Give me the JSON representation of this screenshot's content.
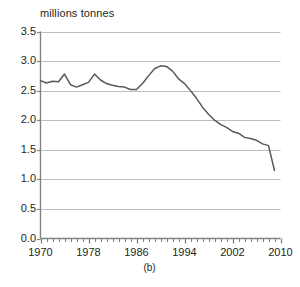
{
  "figure": {
    "caption": "(b)",
    "axis_title": "millions tonnes",
    "line_color": "#58595b",
    "grid_color": "#bcbec0",
    "axis_color": "#808285",
    "text_color": "#231f20"
  },
  "chart_data": {
    "type": "line",
    "title": "",
    "subtitle": "",
    "xlabel": "",
    "ylabel": "millions tonnes",
    "xlim": [
      1970,
      2010
    ],
    "ylim": [
      0.0,
      3.5
    ],
    "grid": true,
    "legend": "none",
    "y_ticks": [
      "0.0",
      "0.5",
      "1.0",
      "1.5",
      "2.0",
      "2.5",
      "3.0",
      "3.5"
    ],
    "y_tick_values": [
      0.0,
      0.5,
      1.0,
      1.5,
      2.0,
      2.5,
      3.0,
      3.5
    ],
    "x_ticks": [
      "1970",
      "1978",
      "1986",
      "1994",
      "2002",
      "2010"
    ],
    "x_tick_values": [
      1970,
      1978,
      1986,
      1994,
      2002,
      2010
    ],
    "x_minor_tick_step": 1,
    "series": [
      {
        "name": "millions tonnes",
        "x": [
          1970,
          1971,
          1972,
          1973,
          1974,
          1975,
          1976,
          1977,
          1978,
          1979,
          1980,
          1981,
          1982,
          1983,
          1984,
          1985,
          1986,
          1987,
          1988,
          1989,
          1990,
          1991,
          1992,
          1993,
          1994,
          1995,
          1996,
          1997,
          1998,
          1999,
          2000,
          2001,
          2002,
          2003,
          2004,
          2005,
          2006,
          2007,
          2008,
          2009
        ],
        "values": [
          2.67,
          2.63,
          2.66,
          2.65,
          2.78,
          2.6,
          2.56,
          2.6,
          2.64,
          2.78,
          2.68,
          2.62,
          2.59,
          2.57,
          2.56,
          2.52,
          2.52,
          2.62,
          2.75,
          2.87,
          2.92,
          2.91,
          2.83,
          2.7,
          2.62,
          2.5,
          2.37,
          2.22,
          2.1,
          2.0,
          1.93,
          1.88,
          1.81,
          1.78,
          1.71,
          1.69,
          1.66,
          1.6,
          1.57,
          1.15
        ]
      }
    ]
  }
}
